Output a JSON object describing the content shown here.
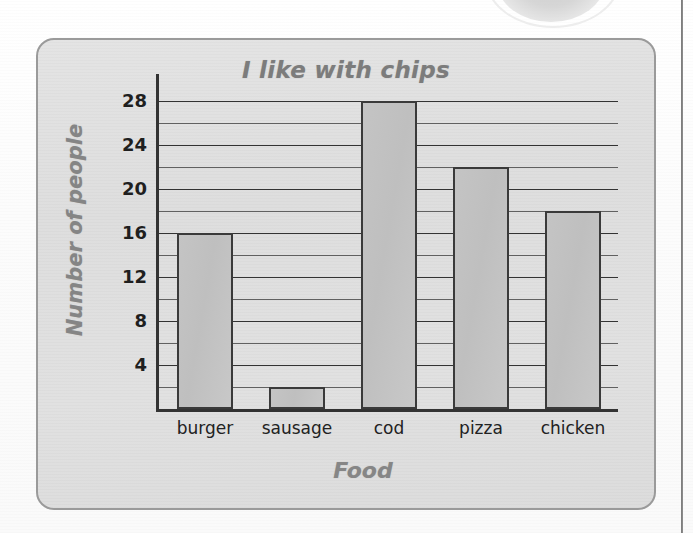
{
  "page": {
    "top_circle_icon": "partial-circle-decoration",
    "right_edge_rule": "vertical-page-rule"
  },
  "chart_data": {
    "type": "bar",
    "title": "I like with chips",
    "xlabel": "Food",
    "ylabel": "Number of people",
    "categories": [
      "burger",
      "sausage",
      "cod",
      "pizza",
      "chicken"
    ],
    "values": [
      16,
      2,
      28,
      22,
      18
    ],
    "ylim": [
      0,
      30
    ],
    "ytick_labels": [
      "4",
      "8",
      "12",
      "16",
      "20",
      "24",
      "28"
    ],
    "ytick_values": [
      4,
      8,
      12,
      16,
      20,
      24,
      28
    ],
    "minor_gridline_values": [
      2,
      6,
      10,
      14,
      18,
      22,
      26
    ],
    "grid": true,
    "legend": false,
    "bar_fill_color": "#c4c4c4",
    "bar_edge_color": "#3a3a3a",
    "panel_background_color": "#e0e0e0",
    "panel_border_color": "#9a9a9a",
    "title_color": "#7c7c7c",
    "axis_label_color": "#868686",
    "tick_label_color": "#1f1f1f"
  }
}
